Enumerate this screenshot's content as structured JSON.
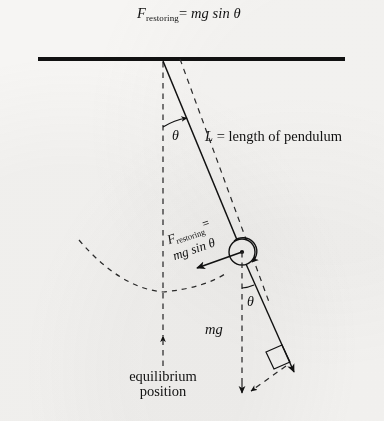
{
  "figure": {
    "type": "physics-diagram",
    "width": 384,
    "height": 421,
    "background_color": "#f6f5f3",
    "ink_color": "#111111"
  },
  "title": {
    "symbol": "F",
    "subscript": "restoring",
    "equals": "=",
    "expression": "mg sin θ",
    "full_text": "F restoring = mg sin θ"
  },
  "labels": {
    "length": "L = length of pendulum",
    "length_symbol": "L",
    "length_text": "= length of pendulum",
    "angle_top": "θ",
    "angle_bob": "θ",
    "weight": "mg",
    "equilibrium_line1": "equilibrium",
    "equilibrium_line2": "position",
    "force_symbol": "F",
    "force_subscript": "restoring",
    "force_equals": "=",
    "force_expression": "mg sin θ"
  },
  "geometry": {
    "ceiling": {
      "x1": 38,
      "y1": 59,
      "x2": 345,
      "y2": 59,
      "thickness": 4
    },
    "pivot": {
      "x": 163,
      "y": 61
    },
    "bob": {
      "cx": 242,
      "cy": 252,
      "r": 13
    },
    "rod_angle_deg": 20,
    "equilibrium_x": 163,
    "equilibrium_bottom_y": 398,
    "weight_line": {
      "x1": 242,
      "y1": 252,
      "x2": 242,
      "y2": 392
    },
    "tension_dashed": {
      "x1": 180,
      "y1": 59,
      "x2": 268,
      "y2": 300
    },
    "swing_arc_radius": 191
  },
  "colors": {
    "ink": "#111111",
    "paper": "#f6f5f3",
    "dashed": "#2a2a2a"
  }
}
